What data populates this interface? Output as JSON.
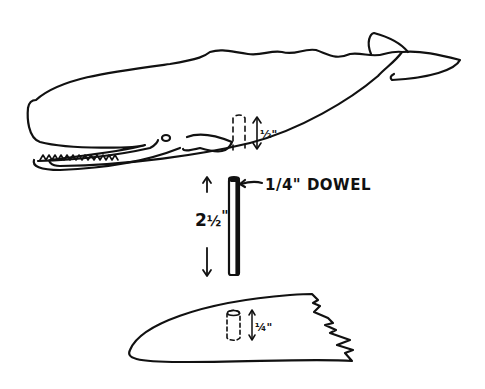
{
  "diagram": {
    "type": "craft assembly drawing",
    "parts": [
      {
        "id": "whale",
        "label": "Whale body",
        "note": "hole drilled in underside"
      },
      {
        "id": "dowel",
        "label": "1/4\" DOWEL"
      },
      {
        "id": "base",
        "label": "Wave base",
        "note": "hole drilled in top"
      }
    ],
    "labels": {
      "dowel": "1/4\" DOWEL",
      "dowel_length_whole": "2",
      "dowel_length_frac": "½",
      "dowel_length_inch": "\"",
      "whale_hole_depth": "½\"",
      "base_hole_depth": "¼\""
    },
    "colors": {
      "ink": "#111111",
      "background": "#ffffff"
    }
  }
}
